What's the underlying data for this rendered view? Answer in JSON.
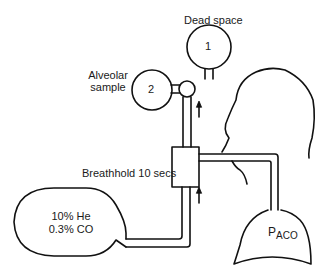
{
  "diagram": {
    "labels": {
      "dead_space": "Dead space",
      "alveolar_sample_line1": "Alveolar",
      "alveolar_sample_line2": "sample",
      "breathhold": "Breathhold 10 secs",
      "bag_line1": "10% He",
      "bag_line2": "0.3% CO",
      "lung_label_main": "P",
      "lung_label_sub": "ACO"
    },
    "bag_numbers": {
      "dead_space_bag": "1",
      "alveolar_sample_bag": "2"
    },
    "colors": {
      "stroke": "#111111",
      "background": "#ffffff"
    }
  }
}
